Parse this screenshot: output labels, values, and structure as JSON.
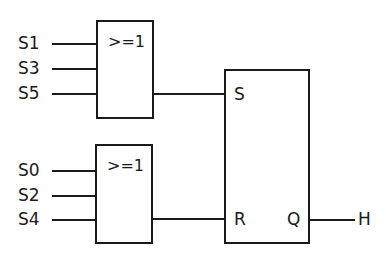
{
  "diagram": {
    "type": "logic-circuit",
    "gates": [
      {
        "id": "or1",
        "label": ">=1",
        "inputs": [
          "S1",
          "S3",
          "S5"
        ],
        "output_to": "S"
      },
      {
        "id": "or2",
        "label": ">=1",
        "inputs": [
          "S0",
          "S2",
          "S4"
        ],
        "output_to": "R"
      }
    ],
    "flipflop": {
      "set_label": "S",
      "reset_label": "R",
      "output_label": "Q",
      "output_signal": "H"
    }
  }
}
